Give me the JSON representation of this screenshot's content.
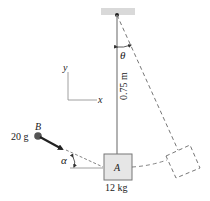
{
  "diagram": {
    "type": "pendulum-impact",
    "labels": {
      "theta": "θ",
      "length": "0.75 m",
      "axis_x": "x",
      "axis_y": "y",
      "bullet_name": "B",
      "bullet_mass": "20 g",
      "alpha": "α",
      "block_name": "A",
      "block_mass": "12 kg"
    },
    "colors": {
      "ceiling": "#d9d9d9",
      "rod": "#999999",
      "block_fill": "#e6e6e6",
      "block_stroke": "#777777",
      "dashed": "#666666",
      "bullet": "#555555",
      "arrow": "#222222",
      "text": "#222222"
    }
  }
}
